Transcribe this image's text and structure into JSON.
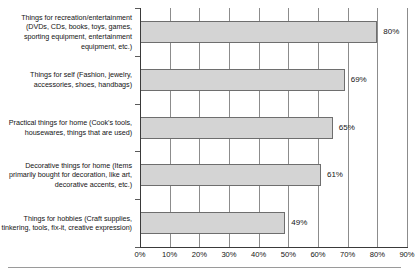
{
  "chart_data": {
    "type": "bar",
    "orientation": "horizontal",
    "title": "",
    "xlabel": "",
    "ylabel": "",
    "xlim": [
      0,
      90
    ],
    "grid": true,
    "legend": false,
    "categories": [
      "Things for recreation/entertainment (DVDs, CDs, books, toys, games, sporting equipment, entertainment equipment, etc.)",
      "Things for self (Fashion, jewelry, accessories, shoes, handbags)",
      "Practical things for home (Cook's tools, housewares, things that are used)",
      "Decorative things for home (Items primarily bought for decoration, like art, decorative accents, etc.)",
      "Things for hobbies (Craft supplies, tinkering, tools, fix-it, creative expression)"
    ],
    "values": [
      80,
      69,
      65,
      61,
      49
    ],
    "value_labels": [
      "80%",
      "69%",
      "65%",
      "61%",
      "49%"
    ],
    "xticks": [
      0,
      10,
      20,
      30,
      40,
      50,
      60,
      70,
      80,
      90
    ],
    "xtick_labels": [
      "0%",
      "10%",
      "20%",
      "30%",
      "40%",
      "50%",
      "60%",
      "70%",
      "80%",
      "90%"
    ],
    "bar_fill_color": "#d4d4d4",
    "bar_border_color": "#6e6e6e",
    "gridline_color": "#8c8c8c",
    "axis_color": "#3a3a3a"
  }
}
